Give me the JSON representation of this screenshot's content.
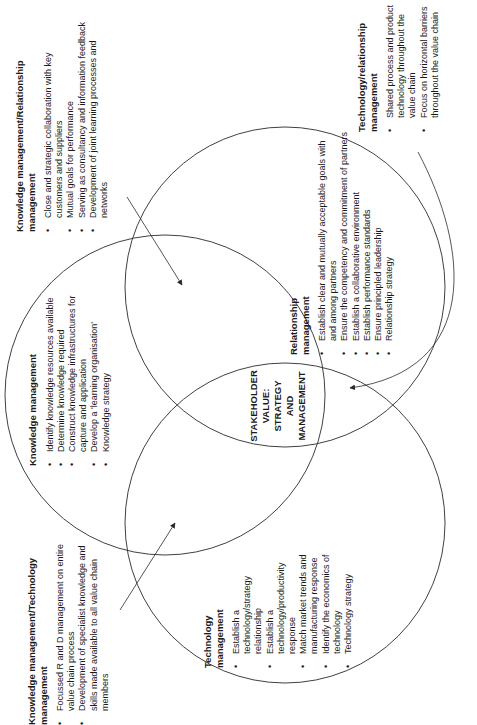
{
  "diagram": {
    "center_label": [
      "STAKEHOLDER",
      "VALUE:",
      "STRATEGY",
      "AND",
      "MANAGEMENT"
    ],
    "circles": [
      {
        "name": "knowledge",
        "cx": 165,
        "cy": 395,
        "r": 160
      },
      {
        "name": "relationship",
        "cx": 285,
        "cy": 287,
        "r": 160
      },
      {
        "name": "technology",
        "cx": 285,
        "cy": 523,
        "r": 160
      }
    ],
    "line_color": "#2a2a2a"
  },
  "blocks": {
    "km_relationship": {
      "title": "Knowledge management/Relationship management",
      "items": [
        "Close and strategic collaboration with key customers and suppliers",
        "Mutual goals for performance",
        "Serving as consultancy and information feedback",
        "Development of joint learning processes and networks"
      ]
    },
    "technology_relationship": {
      "title": "Technology/relationship management",
      "items": [
        "Shared process and product technology throughout the value chain",
        "Focus on horizontal barriers throughout the value chain"
      ]
    },
    "knowledge": {
      "title": "Knowledge management",
      "items": [
        "Identify knowledge resources available",
        "Determine knowledge required",
        "Construct knowledge infrastructures for capture and application",
        "Develop a 'learning organisation'",
        "Knowledge strategy"
      ]
    },
    "relationship": {
      "title": "Relationship management",
      "items": [
        "Establish clear and mutually acceptable goals with and among partners",
        "Ensure the competency and commitment of partners",
        "Establish a collaborative environment",
        "Establish performance standards",
        "Ensure principled leadership",
        "Relationship strategy"
      ]
    },
    "technology": {
      "title": "Technology management",
      "items": [
        "Establish a technology/strategy relationship",
        "Establish a technology/productivity response",
        "Match market trends and manufacturing response",
        "Identify the economics of technology",
        "Technology strategy"
      ]
    },
    "km_technology": {
      "title": "Knowledge management/Technology management",
      "items": [
        "Focussed R and D management on entire value chain process",
        "Development of specialist knowledge and skills made available to all value chain members"
      ]
    }
  }
}
